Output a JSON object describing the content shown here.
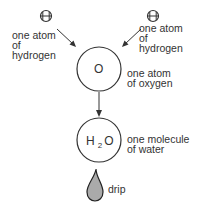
{
  "diagram": {
    "type": "chemical-formation",
    "hydrogen_left": {
      "symbol": "H",
      "label": "one atom\nof\nhydrogen"
    },
    "hydrogen_right": {
      "symbol": "H",
      "label": "one atom\nof\nhydrogen"
    },
    "oxygen": {
      "symbol": "O",
      "label": "one atom\nof oxygen"
    },
    "water": {
      "symbol_main": "H",
      "symbol_sub": "2",
      "symbol_end": "O",
      "label": "one molecule\nof water"
    },
    "drip": {
      "label": "drip",
      "fill": "#aaaaaa"
    }
  }
}
